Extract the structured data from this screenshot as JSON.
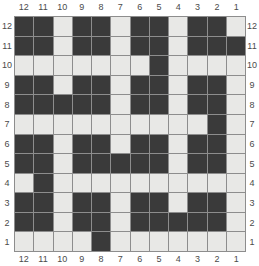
{
  "chart_data": {
    "type": "heatmap",
    "title": "",
    "subtitle": "",
    "xlabel": "",
    "ylabel": "",
    "grid": true,
    "legend_position": "none",
    "colors": {
      "filled": "#3a3a3a",
      "empty": "#e8e8e6",
      "gridline": "#8d8d8d",
      "label": "#4a4a4a",
      "background": "#ffffff"
    },
    "columns": 12,
    "rows": 12,
    "axis_top_labels": [
      "12",
      "11",
      "10",
      "9",
      "8",
      "7",
      "6",
      "5",
      "4",
      "3",
      "2",
      "1"
    ],
    "axis_bottom_labels": [
      "12",
      "11",
      "10",
      "9",
      "8",
      "7",
      "6",
      "5",
      "4",
      "3",
      "2",
      "1"
    ],
    "axis_left_labels": [
      "12",
      "11",
      "10",
      "9",
      "8",
      "7",
      "6",
      "5",
      "4",
      "3",
      "2",
      "1"
    ],
    "axis_right_labels": [
      "12",
      "11",
      "10",
      "9",
      "8",
      "7",
      "6",
      "5",
      "4",
      "3",
      "2",
      "1"
    ],
    "cell_legend": {
      "1": "filled",
      "0": "empty"
    },
    "matrix": [
      [
        1,
        1,
        0,
        1,
        1,
        0,
        1,
        1,
        0,
        1,
        1,
        0
      ],
      [
        1,
        1,
        0,
        1,
        1,
        0,
        1,
        1,
        0,
        1,
        1,
        1
      ],
      [
        0,
        0,
        0,
        0,
        0,
        0,
        0,
        1,
        0,
        0,
        0,
        0
      ],
      [
        1,
        1,
        0,
        1,
        1,
        0,
        1,
        1,
        0,
        1,
        1,
        0
      ],
      [
        1,
        1,
        1,
        1,
        1,
        0,
        1,
        1,
        0,
        1,
        1,
        0
      ],
      [
        0,
        0,
        0,
        0,
        0,
        0,
        0,
        0,
        0,
        0,
        1,
        0
      ],
      [
        1,
        1,
        0,
        1,
        1,
        0,
        1,
        1,
        0,
        1,
        1,
        0
      ],
      [
        1,
        1,
        0,
        1,
        1,
        1,
        1,
        1,
        0,
        1,
        1,
        0
      ],
      [
        0,
        1,
        0,
        0,
        0,
        0,
        0,
        0,
        0,
        0,
        0,
        0
      ],
      [
        1,
        1,
        0,
        1,
        1,
        0,
        1,
        1,
        0,
        1,
        1,
        0
      ],
      [
        1,
        1,
        0,
        1,
        1,
        0,
        1,
        1,
        1,
        1,
        1,
        0
      ],
      [
        0,
        0,
        0,
        0,
        1,
        0,
        0,
        0,
        0,
        0,
        0,
        0
      ]
    ],
    "matrix_row_labels_top_to_bottom": [
      "12",
      "11",
      "10",
      "9",
      "8",
      "7",
      "6",
      "5",
      "4",
      "3",
      "2",
      "1"
    ],
    "matrix_col_labels_left_to_right": [
      "12",
      "11",
      "10",
      "9",
      "8",
      "7",
      "6",
      "5",
      "4",
      "3",
      "2",
      "1"
    ]
  }
}
